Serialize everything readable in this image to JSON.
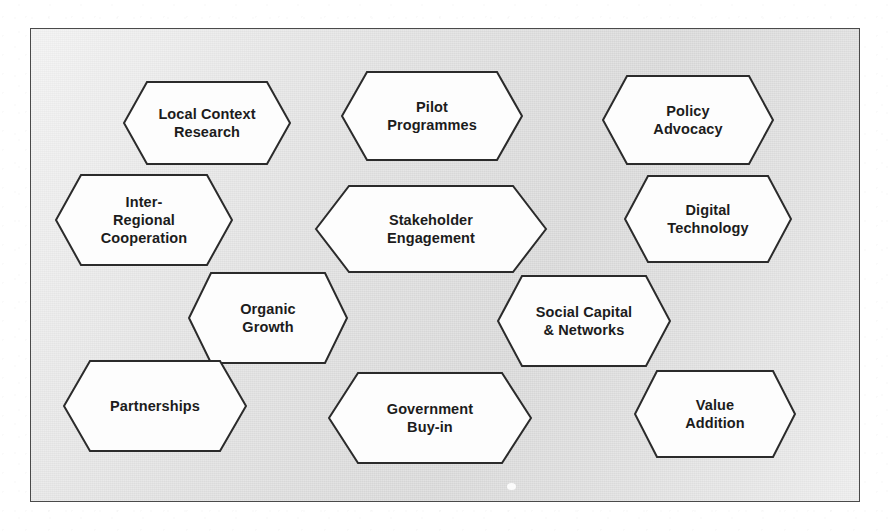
{
  "diagram": {
    "frame": {
      "x": 30,
      "y": 28,
      "width": 830,
      "height": 474,
      "border_color": "#4a4a4a",
      "background_start": "#f1f1f1",
      "background_end": "#d8d8d8"
    },
    "node_style": {
      "fill": "#fdfdfd",
      "stroke": "#2b2b2b",
      "stroke_width": 2,
      "text_color": "#1c1c1c"
    },
    "artifact": {
      "name": "dust-speck",
      "x": 506,
      "y": 482,
      "width": 9,
      "height": 7,
      "color": "#fbfbfb"
    },
    "nodes": [
      {
        "id": "local-context-research",
        "label": "Local Context\nResearch",
        "x": 122,
        "y": 80,
        "width": 168,
        "height": 84,
        "font_size": 14.5
      },
      {
        "id": "pilot-programmes",
        "label": "Pilot\nProgrammes",
        "x": 340,
        "y": 70,
        "width": 182,
        "height": 90,
        "font_size": 14.5
      },
      {
        "id": "policy-advocacy",
        "label": "Policy\nAdvocacy",
        "x": 601,
        "y": 74,
        "width": 172,
        "height": 90,
        "font_size": 14.5
      },
      {
        "id": "inter-regional-cooperation",
        "label": "Inter-\nRegional\nCooperation",
        "x": 54,
        "y": 173,
        "width": 178,
        "height": 92,
        "font_size": 14.5
      },
      {
        "id": "stakeholder-engagement",
        "label": "Stakeholder\nEngagement",
        "x": 314,
        "y": 184,
        "width": 232,
        "height": 88,
        "font_size": 14.5
      },
      {
        "id": "digital-technology",
        "label": "Digital\nTechnology",
        "x": 623,
        "y": 174,
        "width": 168,
        "height": 88,
        "font_size": 14.5
      },
      {
        "id": "organic-growth",
        "label": "Organic\nGrowth",
        "x": 187,
        "y": 271,
        "width": 160,
        "height": 92,
        "font_size": 14.5
      },
      {
        "id": "social-capital-networks",
        "label": "Social Capital\n& Networks",
        "x": 496,
        "y": 274,
        "width": 174,
        "height": 92,
        "font_size": 14.5
      },
      {
        "id": "partnerships",
        "label": "Partnerships",
        "x": 62,
        "y": 359,
        "width": 184,
        "height": 92,
        "font_size": 14.5
      },
      {
        "id": "government-buy-in",
        "label": "Government\nBuy-in",
        "x": 327,
        "y": 371,
        "width": 204,
        "height": 92,
        "font_size": 14.5
      },
      {
        "id": "value-addition",
        "label": "Value\nAddition",
        "x": 633,
        "y": 369,
        "width": 162,
        "height": 88,
        "font_size": 14.5
      }
    ]
  }
}
